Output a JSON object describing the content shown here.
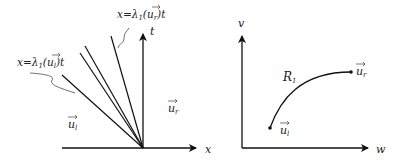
{
  "left_diagram": {
    "axes": {
      "x_label": "x",
      "t_label": "t"
    },
    "annotations": {
      "left_line": {
        "prefix": "x=λ",
        "sub": "1",
        "open": "(",
        "vec": "u",
        "vec_sub": "l",
        "close": ")t"
      },
      "right_line": {
        "prefix": "x=λ",
        "sub": "1",
        "open": "(",
        "vec": "u",
        "vec_sub": "r",
        "close": ")t"
      }
    },
    "regions": {
      "left_state": {
        "vec": "u",
        "sub": "l"
      },
      "right_state": {
        "vec": "u",
        "sub": "r"
      }
    },
    "fan_line_count": 4
  },
  "right_diagram": {
    "axes": {
      "h_label": "w",
      "v_label": "v"
    },
    "curve_label": {
      "main": "R",
      "sub": "1"
    },
    "points": {
      "start": {
        "vec": "u",
        "sub": "l"
      },
      "end": {
        "vec": "u",
        "sub": "r"
      }
    }
  },
  "colors": {
    "ink": "#222222",
    "background": "#ffffff"
  }
}
